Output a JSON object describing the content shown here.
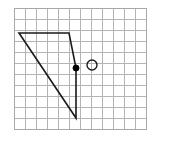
{
  "figure": {
    "background_color": "#ffffff",
    "canvas": {
      "width": 174,
      "height": 149
    }
  },
  "grid": {
    "name": "square-grid",
    "origin_x": 14,
    "origin_y": 8,
    "cell_size": 11,
    "columns": 12,
    "rows": 11,
    "line_color": "#b4b4b4",
    "line_width": 1,
    "border_color": "#a8a8a8",
    "border_width": 1
  },
  "shape": {
    "name": "quadrilateral",
    "type": "polygon",
    "closed": true,
    "stroke_color": "#1a1a1a",
    "stroke_width": 1.6,
    "fill": "none",
    "vertices": [
      {
        "label": "top-left",
        "x": 19,
        "y": 33
      },
      {
        "label": "top-right",
        "x": 69,
        "y": 33
      },
      {
        "label": "middle-right",
        "x": 76,
        "y": 68
      },
      {
        "label": "bottom",
        "x": 76,
        "y": 118
      }
    ],
    "edges": [
      {
        "from": "top-left",
        "to": "top-right",
        "orientation": "horizontal"
      },
      {
        "from": "top-right",
        "to": "middle-right",
        "orientation": "slanted"
      },
      {
        "from": "middle-right",
        "to": "bottom",
        "orientation": "vertical"
      },
      {
        "from": "bottom",
        "to": "top-left",
        "orientation": "diagonal"
      }
    ]
  },
  "markers": [
    {
      "name": "filled-point",
      "type": "dot",
      "x": 76,
      "y": 68,
      "radius": 3,
      "fill_color": "#000000",
      "stroke_color": "#000000"
    },
    {
      "name": "open-circle",
      "type": "circle",
      "x": 92,
      "y": 65,
      "radius": 5,
      "fill_color": "none",
      "stroke_color": "#1a1a1a",
      "stroke_width": 1.4
    }
  ]
}
